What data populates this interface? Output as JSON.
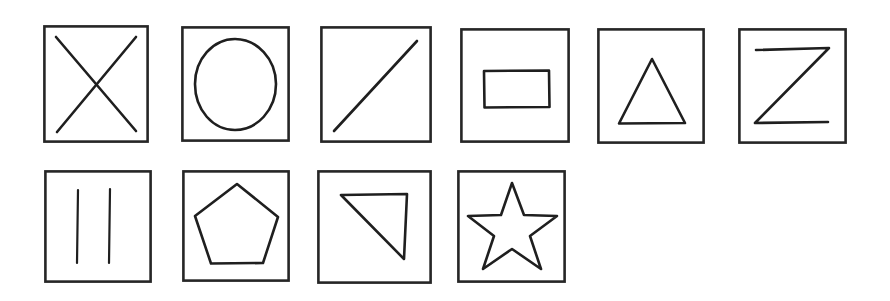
{
  "page": {
    "background_color": "#ffffff",
    "ink_color": "#1f1f1f",
    "frame_color": "#262626",
    "width": 890,
    "height": 301,
    "rows": 2,
    "card_count": 10
  },
  "cards": [
    {
      "index": 1,
      "row": 1,
      "column": 1,
      "shape_name": "cross-x",
      "label": "X",
      "description": "two diagonal strokes crossing in the middle",
      "x": 43,
      "y": 25,
      "w": 106,
      "h": 118
    },
    {
      "index": 2,
      "row": 1,
      "column": 2,
      "shape_name": "circle",
      "label": "Circle",
      "description": "single closed round outline",
      "x": 181,
      "y": 26,
      "w": 109,
      "h": 116
    },
    {
      "index": 3,
      "row": 1,
      "column": 3,
      "shape_name": "diagonal-line",
      "label": "Diagonal line",
      "description": "one stroke from lower-left to upper-right",
      "x": 320,
      "y": 26,
      "w": 112,
      "h": 117
    },
    {
      "index": 4,
      "row": 1,
      "column": 4,
      "shape_name": "rectangle",
      "label": "Rectangle",
      "description": "small horizontal rectangle centered in the frame",
      "x": 460,
      "y": 28,
      "w": 110,
      "h": 115
    },
    {
      "index": 5,
      "row": 1,
      "column": 5,
      "shape_name": "triangle",
      "label": "Triangle",
      "description": "upright closed triangle",
      "x": 597,
      "y": 28,
      "w": 108,
      "h": 116
    },
    {
      "index": 6,
      "row": 1,
      "column": 6,
      "shape_name": "letter-z",
      "label": "Z",
      "description": "top bar, diagonal, bottom bar",
      "x": 738,
      "y": 28,
      "w": 109,
      "h": 116
    },
    {
      "index": 7,
      "row": 2,
      "column": 1,
      "shape_name": "two-vertical-lines",
      "label": "Two vertical lines",
      "description": "a pair of parallel vertical strokes",
      "x": 44,
      "y": 170,
      "w": 108,
      "h": 113
    },
    {
      "index": 8,
      "row": 2,
      "column": 2,
      "shape_name": "pentagon",
      "label": "Pentagon",
      "description": "five-sided closed polygon, point up",
      "x": 182,
      "y": 170,
      "w": 108,
      "h": 112
    },
    {
      "index": 9,
      "row": 2,
      "column": 3,
      "shape_name": "right-triangle",
      "label": "Right triangle",
      "description": "right triangle with hypotenuse from top-left to bottom-right",
      "x": 317,
      "y": 170,
      "w": 115,
      "h": 114
    },
    {
      "index": 10,
      "row": 2,
      "column": 4,
      "shape_name": "five-point-star",
      "label": "Star",
      "description": "five-pointed star outline",
      "x": 457,
      "y": 170,
      "w": 109,
      "h": 113
    }
  ]
}
